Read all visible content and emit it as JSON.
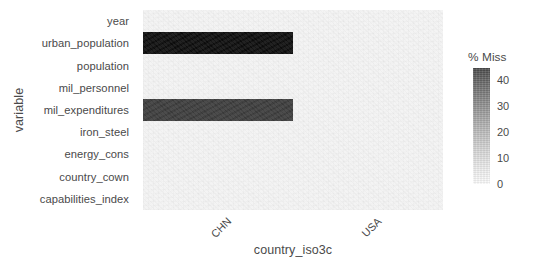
{
  "chart_data": {
    "type": "heatmap",
    "title": "",
    "xlabel": "country_iso3c",
    "ylabel": "variable",
    "x_categories": [
      "CHN",
      "USA"
    ],
    "y_categories": [
      "year",
      "urban_population",
      "population",
      "mil_personnel",
      "mil_expenditures",
      "iron_steel",
      "energy_cons",
      "country_cown",
      "capabilities_index"
    ],
    "legend": {
      "title": "% Miss",
      "ticks": [
        40,
        30,
        20,
        10,
        0
      ],
      "range": [
        0,
        45
      ],
      "position": "right",
      "gradient_low_color": "#ffffff",
      "gradient_high_color": "#404040"
    },
    "grid": false,
    "panel_background": "#f3f3f3",
    "cells": [
      {
        "y": "year",
        "x": "CHN",
        "value": 0
      },
      {
        "y": "year",
        "x": "USA",
        "value": 0
      },
      {
        "y": "urban_population",
        "x": "CHN",
        "value": 45
      },
      {
        "y": "urban_population",
        "x": "USA",
        "value": 0
      },
      {
        "y": "population",
        "x": "CHN",
        "value": 0
      },
      {
        "y": "population",
        "x": "USA",
        "value": 0
      },
      {
        "y": "mil_personnel",
        "x": "CHN",
        "value": 0
      },
      {
        "y": "mil_personnel",
        "x": "USA",
        "value": 0
      },
      {
        "y": "mil_expenditures",
        "x": "CHN",
        "value": 38
      },
      {
        "y": "mil_expenditures",
        "x": "USA",
        "value": 0
      },
      {
        "y": "iron_steel",
        "x": "CHN",
        "value": 0
      },
      {
        "y": "iron_steel",
        "x": "USA",
        "value": 0
      },
      {
        "y": "energy_cons",
        "x": "CHN",
        "value": 0
      },
      {
        "y": "energy_cons",
        "x": "USA",
        "value": 0
      },
      {
        "y": "country_cown",
        "x": "CHN",
        "value": 0
      },
      {
        "y": "country_cown",
        "x": "USA",
        "value": 0
      },
      {
        "y": "capabilities_index",
        "x": "CHN",
        "value": 0
      },
      {
        "y": "capabilities_index",
        "x": "USA",
        "value": 0
      }
    ],
    "cell_colors": [
      {
        "y": "urban_population",
        "x": "CHN",
        "color": "#0c0c0c"
      },
      {
        "y": "mil_expenditures",
        "x": "CHN",
        "color": "#3b3b3b"
      }
    ]
  }
}
